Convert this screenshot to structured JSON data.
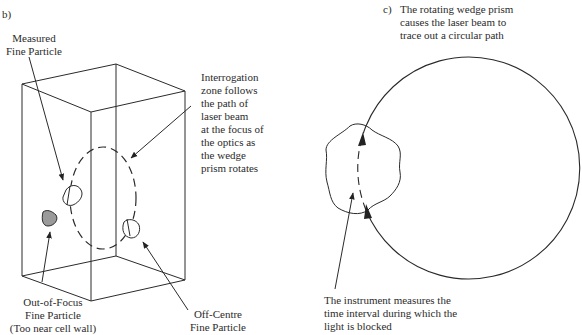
{
  "panel_b": {
    "tag": "b)",
    "labels": {
      "measured": [
        "Measured",
        "Fine Particle"
      ],
      "interrogation": [
        "Interrogation",
        "zone follows",
        "the path of",
        "laser beam",
        "at the focus of",
        "the optics as",
        "the wedge",
        "prism rotates"
      ],
      "out_of_focus": [
        "Out-of-Focus",
        "Fine Particle",
        "(Too near cell wall)"
      ],
      "off_centre": [
        "Off-Centre",
        "Fine Particle"
      ]
    },
    "colors": {
      "line": "#2a2a2a",
      "particle_gray": "#9a9a9a"
    }
  },
  "panel_c": {
    "tag": "c)",
    "title": [
      "The rotating wedge prism",
      "causes the laser beam to",
      "trace out a circular path"
    ],
    "caption": [
      "The instrument measures the",
      "time interval during which the",
      "light is blocked"
    ],
    "colors": {
      "line": "#2a2a2a"
    }
  }
}
